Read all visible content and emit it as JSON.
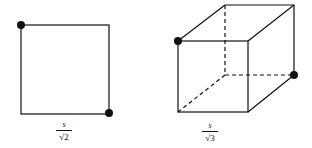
{
  "figures": [
    {
      "name": "square",
      "label": {
        "numerator": "s",
        "denominator": "√2"
      },
      "vertices": [
        [
          21,
          25
        ],
        [
          109,
          25
        ],
        [
          109,
          114
        ],
        [
          21,
          114
        ]
      ],
      "dots": [
        [
          21,
          25
        ],
        [
          109,
          113
        ]
      ]
    },
    {
      "name": "cube",
      "label": {
        "numerator": "s",
        "denominator": "√3"
      },
      "front_face": [
        [
          178,
          41
        ],
        [
          248,
          41
        ],
        [
          248,
          112
        ],
        [
          178,
          112
        ]
      ],
      "back_face": [
        [
          225,
          5
        ],
        [
          294,
          5
        ],
        [
          294,
          75
        ],
        [
          225,
          75
        ]
      ],
      "dots": [
        [
          178,
          41
        ],
        [
          294,
          75
        ]
      ]
    }
  ],
  "colors": {
    "stroke": "#111111",
    "background": "#ffffff"
  }
}
